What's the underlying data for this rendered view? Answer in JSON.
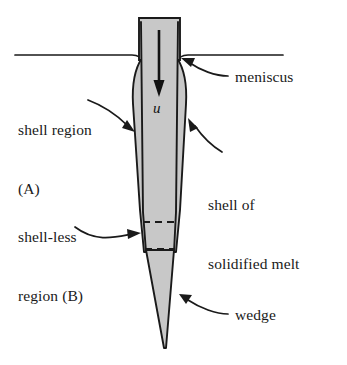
{
  "figure": {
    "kind": "schematic-diagram",
    "background_color": "#ffffff",
    "line_color": "#1a1a1a",
    "fill_gray": "#c8c8c8",
    "shell_fill_gray": "#c8c8c8"
  },
  "labels": {
    "shell_region": {
      "line1": "shell region",
      "line2": "(A)"
    },
    "shell_less_region": {
      "line1": "shell-less",
      "line2": "region (B)"
    },
    "meniscus": "meniscus",
    "shell_of_melt": {
      "line1": "shell of",
      "line2": "solidified melt"
    },
    "wedge": "wedge",
    "velocity": "u"
  },
  "annotations": {
    "velocity_arrow": "downward-arrow",
    "dashed_boundaries": 2,
    "leader_arrows": [
      "shell-region-leader",
      "shell-less-region-leader",
      "meniscus-leader",
      "shell-of-melt-leader",
      "wedge-leader"
    ]
  },
  "geometry": {
    "wedge_top_y": 18,
    "meniscus_y": 55,
    "dashed_line_1_y": 222,
    "dashed_line_2_y": 248,
    "tip_y": 348
  }
}
